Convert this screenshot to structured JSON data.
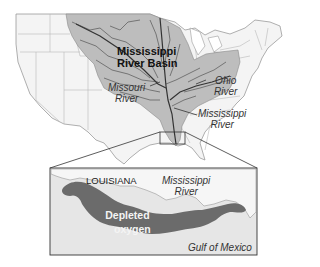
{
  "map": {
    "basin_label": [
      "Mississippi",
      "River Basin"
    ],
    "missouri_label": [
      "Missouri",
      "River"
    ],
    "ohio_label": [
      "Ohio",
      "River"
    ],
    "mississippi_label": [
      "Mississippi",
      "River"
    ]
  },
  "inset": {
    "state_label": "LOUISIANA",
    "river_label": [
      "Mississippi",
      "River"
    ],
    "zone_label": [
      "Depleted",
      "oxygen"
    ],
    "water_label": "Gulf of Mexico"
  },
  "colors": {
    "basin_fill": "#bdbdbd",
    "land_fill": "#f4f4f4",
    "water_fill": "#e6e6e6",
    "hypoxia_fill": "#6b6b6b",
    "border": "#8a8a8a",
    "river": "#444444"
  }
}
